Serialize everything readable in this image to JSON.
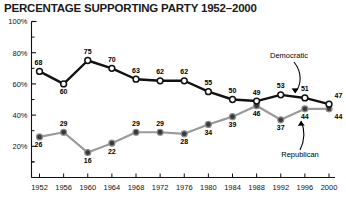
{
  "chart_data": {
    "type": "line",
    "title": "PERCENTAGE SUPPORTING PARTY 1952–2000",
    "xlabel": "",
    "ylabel": "",
    "categories": [
      "1952",
      "1956",
      "1960",
      "1964",
      "1968",
      "1972",
      "1976",
      "1980",
      "1984",
      "1988",
      "1992",
      "1996",
      "2000"
    ],
    "x": [
      1952,
      1956,
      1960,
      1964,
      1968,
      1972,
      1976,
      1980,
      1984,
      1988,
      1992,
      1996,
      2000
    ],
    "ylim": [
      0,
      100
    ],
    "yticks": [
      20,
      40,
      60,
      80,
      100
    ],
    "ytick_labels": [
      "20%",
      "40%",
      "60%",
      "80%",
      "100%"
    ],
    "grid": false,
    "legend_position": "inline-annotation",
    "series": [
      {
        "name": "Democratic",
        "color": "#111111",
        "marker": "open-circle",
        "values": [
          68,
          60,
          75,
          70,
          63,
          62,
          62,
          55,
          50,
          49,
          53,
          51,
          47
        ],
        "label_positions": [
          "above",
          "below",
          "above",
          "above",
          "above",
          "above",
          "above",
          "above",
          "above",
          "above",
          "above",
          "above",
          "above"
        ]
      },
      {
        "name": "Republican",
        "color": "#9a9a9a",
        "marker": "filled-circle",
        "values": [
          26,
          29,
          16,
          22,
          29,
          29,
          28,
          34,
          39,
          46,
          37,
          44,
          44
        ],
        "label_positions": [
          "below",
          "above",
          "below",
          "below",
          "above",
          "above",
          "below",
          "below",
          "below",
          "below",
          "below",
          "below",
          "below"
        ]
      }
    ],
    "annotations": [
      {
        "text": "Democratic",
        "target_series": "Democratic"
      },
      {
        "text": "Republican",
        "target_series": "Republican"
      }
    ]
  }
}
